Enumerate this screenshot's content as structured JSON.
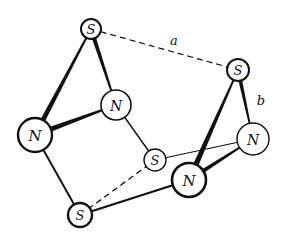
{
  "diagram": {
    "colors": {
      "ink": "#111111",
      "background": "#ffffff"
    },
    "atoms": [
      {
        "id": "S1",
        "label": "S",
        "x": 91,
        "y": 29,
        "r": 10,
        "stroke": 2.0,
        "font": 13
      },
      {
        "id": "N1",
        "label": "N",
        "x": 116,
        "y": 105,
        "r": 15,
        "stroke": 1.6,
        "font": 14
      },
      {
        "id": "N2",
        "label": "N",
        "x": 35,
        "y": 135,
        "r": 17,
        "stroke": 2.4,
        "font": 15
      },
      {
        "id": "S2",
        "label": "S",
        "x": 155,
        "y": 160,
        "r": 11,
        "stroke": 1.4,
        "font": 13
      },
      {
        "id": "S3",
        "label": "S",
        "x": 80,
        "y": 215,
        "r": 12,
        "stroke": 2.4,
        "font": 13
      },
      {
        "id": "N3",
        "label": "N",
        "x": 189,
        "y": 180,
        "r": 17,
        "stroke": 2.6,
        "font": 15
      },
      {
        "id": "S4",
        "label": "S",
        "x": 238,
        "y": 70,
        "r": 11,
        "stroke": 2.0,
        "font": 13
      },
      {
        "id": "N4",
        "label": "N",
        "x": 253,
        "y": 139,
        "r": 16,
        "stroke": 1.4,
        "font": 14
      }
    ],
    "bonds": [
      {
        "from": "S1",
        "to": "N2",
        "style": "wedge",
        "w1": 1.5,
        "w2": 5.5
      },
      {
        "from": "S1",
        "to": "N1",
        "style": "wedge",
        "w1": 4.5,
        "w2": 1.5
      },
      {
        "from": "N2",
        "to": "N1",
        "style": "wedge",
        "w1": 6.0,
        "w2": 1.5
      },
      {
        "from": "N2",
        "to": "S3",
        "style": "solid",
        "w": 2.0
      },
      {
        "from": "N1",
        "to": "S2",
        "style": "solid",
        "w": 1.4
      },
      {
        "from": "S2",
        "to": "N4",
        "style": "solid",
        "w": 1.2
      },
      {
        "from": "S3",
        "to": "S2",
        "style": "dashed",
        "w": 1.3
      },
      {
        "from": "S3",
        "to": "N3",
        "style": "solid",
        "w": 2.2
      },
      {
        "from": "N3",
        "to": "S4",
        "style": "wedge",
        "w1": 6.0,
        "w2": 1.5
      },
      {
        "from": "N3",
        "to": "N4",
        "style": "wedge",
        "w1": 5.0,
        "w2": 1.5
      },
      {
        "from": "S4",
        "to": "N4",
        "style": "wedge",
        "w1": 4.0,
        "w2": 1.3
      },
      {
        "from": "S1",
        "to": "S4",
        "style": "dashed",
        "w": 1.2
      }
    ],
    "labels": [
      {
        "id": "a",
        "text": "a",
        "x": 174,
        "y": 40
      },
      {
        "id": "b",
        "text": "b",
        "x": 261,
        "y": 100
      }
    ]
  }
}
